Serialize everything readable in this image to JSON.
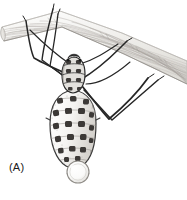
{
  "figure": {
    "panel_label": "(A)",
    "caption_visible": false,
    "background_color": "#ffffff",
    "width_px": 187,
    "height_px": 200,
    "medium": "pen-and-ink stipple scientific illustration"
  },
  "palette": {
    "ink_black": "#1a1a1a",
    "ink_dark": "#2b2b2b",
    "leg_line": "#262626",
    "body_outline": "#3a3a3a",
    "body_fill": "#f2f1ef",
    "body_shade": "#cfcdc9",
    "spot_dark": "#3d3a38",
    "spot_mid": "#6a6663",
    "branch_fill": "#f4f3f1",
    "branch_grain_light": "#d8d6d2",
    "branch_grain_mid": "#b9b6b1",
    "branch_edge": "#9a9792",
    "droplet_outline": "#8e8b86",
    "droplet_fill": "#fbfbfa",
    "label_color": "#1a1a1a"
  },
  "branch": {
    "name": "woody twig",
    "orientation": "diagonal from upper-left to lower-right",
    "cut_end": "upper-left",
    "grain_line_count": 26,
    "top_edge": [
      [
        2,
        28
      ],
      [
        60,
        12
      ],
      [
        120,
        34
      ],
      [
        186,
        62
      ]
    ],
    "bottom_edge": [
      [
        4,
        40
      ],
      [
        62,
        26
      ],
      [
        124,
        52
      ],
      [
        186,
        82
      ]
    ]
  },
  "insect": {
    "name": "aphid",
    "posture": "hanging upside down beneath twig",
    "head_thorax": {
      "center_x": 74,
      "center_y": 72,
      "width": 22,
      "height": 30,
      "segment_count": 4
    },
    "abdomen": {
      "center_x": 73,
      "center_y": 126,
      "width": 42,
      "height": 74,
      "spot_rows": 6,
      "spot_columns": 4,
      "spot_total": 21
    },
    "legs": [
      {
        "id": "leg-front-left",
        "joints": [
          [
            72,
            76
          ],
          [
            34,
            58
          ],
          [
            26,
            21
          ]
        ]
      },
      {
        "id": "leg-mid-left",
        "joints": [
          [
            73,
            82
          ],
          [
            42,
            60
          ],
          [
            53,
            9
          ]
        ]
      },
      {
        "id": "leg-hind-left",
        "joints": [
          [
            75,
            86
          ],
          [
            50,
            66
          ],
          [
            58,
            14
          ]
        ]
      },
      {
        "id": "leg-front-right",
        "joints": [
          [
            80,
            80
          ],
          [
            120,
            48
          ],
          [
            127,
            41
          ]
        ]
      },
      {
        "id": "leg-mid-right",
        "joints": [
          [
            82,
            86
          ],
          [
            109,
            119
          ],
          [
            148,
            78
          ]
        ]
      },
      {
        "id": "leg-hind-right",
        "joints": [
          [
            84,
            90
          ],
          [
            112,
            120
          ],
          [
            158,
            80
          ]
        ]
      }
    ],
    "antennae": [
      {
        "id": "antenna-left",
        "joints": [
          [
            70,
            64
          ],
          [
            48,
            48
          ],
          [
            30,
            30
          ]
        ]
      },
      {
        "id": "antenna-right",
        "joints": [
          [
            80,
            64
          ],
          [
            100,
            58
          ],
          [
            118,
            44
          ]
        ]
      }
    ]
  },
  "droplet": {
    "name": "honeydew droplet",
    "center_x": 78,
    "center_y": 172,
    "radius": 11,
    "attached_to": "abdomen tip"
  }
}
